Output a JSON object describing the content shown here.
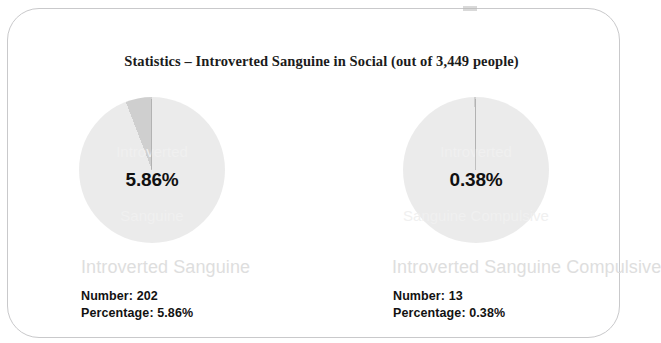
{
  "card": {
    "title": "Statistics – Introverted Sanguine in Social (out of 3,449 people)",
    "total_people": "3,449"
  },
  "colors": {
    "pie_remainder": "#ebebeb",
    "pie_slice": "#cfcfcf",
    "slice_outline": "#9b9b9b",
    "legend_text": "#dedede",
    "detail_text": "#121212",
    "card_border": "#c9c9cb"
  },
  "panels": [
    {
      "legend_label": "Introverted Sanguine",
      "pie_center_label": "5.86%",
      "number_line": "Number: 202",
      "percentage_line": "Percentage: 5.86%",
      "ghost_line_1": "Introverted",
      "ghost_line_2": "Sanguine"
    },
    {
      "legend_label": "Introverted Sanguine Compulsive",
      "pie_center_label": "0.38%",
      "number_line": "Number: 13",
      "percentage_line": "Percentage: 0.38%",
      "ghost_line_1": "Introverted",
      "ghost_line_2": "Sanguine Compulsive"
    }
  ],
  "chart_data": {
    "type": "pie",
    "title": "Statistics – Introverted Sanguine in Social (out of 3,449 people)",
    "total": 3449,
    "charts": [
      {
        "name": "Introverted Sanguine",
        "slices": [
          {
            "label": "Introverted Sanguine",
            "value": 202,
            "percent": 5.86,
            "color": "#cfcfcf"
          },
          {
            "label": "Other",
            "value": 3247,
            "percent": 94.14,
            "color": "#ebebeb"
          }
        ],
        "start_angle_deg": 0,
        "direction": "counterclockwise",
        "data_label": "5.86%"
      },
      {
        "name": "Introverted Sanguine Compulsive",
        "slices": [
          {
            "label": "Introverted Sanguine Compulsive",
            "value": 13,
            "percent": 0.38,
            "color": "#cfcfcf"
          },
          {
            "label": "Other",
            "value": 3436,
            "percent": 99.62,
            "color": "#ebebeb"
          }
        ],
        "start_angle_deg": 0,
        "direction": "counterclockwise",
        "data_label": "0.38%"
      }
    ],
    "legend_position": "below-chart",
    "grid": false
  }
}
